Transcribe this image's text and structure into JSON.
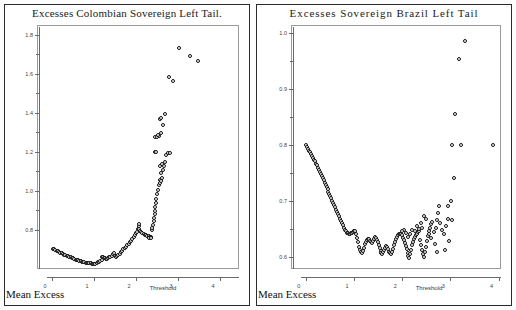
{
  "figure": {
    "axis_corner_label": "Mean Excess",
    "panels": [
      "left",
      "right"
    ]
  },
  "chart_data": [
    {
      "id": "colombia",
      "type": "scatter",
      "title": "Excesses Colombian Sovereign Left Tail.",
      "xlabel": "Threshold",
      "ylabel": "Mean Excess",
      "xlim": [
        -0.12,
        4.45
      ],
      "ylim": [
        0.6,
        1.84
      ],
      "xticks": [
        0,
        1,
        2,
        3,
        4
      ],
      "xticklabels": [
        "0",
        "1",
        "2",
        "3",
        "4"
      ],
      "yticks": [
        0.8,
        1.0,
        1.2,
        1.4,
        1.6,
        1.8
      ],
      "yticklabels": [
        "0.8",
        "1.0",
        "1.2",
        "1.4",
        "1.6",
        "1.8"
      ],
      "grid": false,
      "legend": null,
      "marker": "open-circle",
      "points": [
        [
          0.02,
          0.705
        ],
        [
          0.05,
          0.7
        ],
        [
          0.08,
          0.697
        ],
        [
          0.11,
          0.693
        ],
        [
          0.14,
          0.69
        ],
        [
          0.17,
          0.687
        ],
        [
          0.2,
          0.683
        ],
        [
          0.23,
          0.68
        ],
        [
          0.26,
          0.677
        ],
        [
          0.29,
          0.674
        ],
        [
          0.32,
          0.671
        ],
        [
          0.35,
          0.668
        ],
        [
          0.38,
          0.665
        ],
        [
          0.41,
          0.662
        ],
        [
          0.44,
          0.66
        ],
        [
          0.47,
          0.657
        ],
        [
          0.5,
          0.654
        ],
        [
          0.53,
          0.651
        ],
        [
          0.56,
          0.648
        ],
        [
          0.59,
          0.646
        ],
        [
          0.62,
          0.644
        ],
        [
          0.65,
          0.642
        ],
        [
          0.68,
          0.64
        ],
        [
          0.71,
          0.638
        ],
        [
          0.74,
          0.636
        ],
        [
          0.77,
          0.634
        ],
        [
          0.8,
          0.633
        ],
        [
          0.83,
          0.632
        ],
        [
          0.86,
          0.631
        ],
        [
          0.89,
          0.63
        ],
        [
          0.92,
          0.629
        ],
        [
          0.95,
          0.628
        ],
        [
          0.98,
          0.627
        ],
        [
          1.0,
          0.626
        ],
        [
          1.03,
          0.628
        ],
        [
          1.06,
          0.631
        ],
        [
          1.09,
          0.634
        ],
        [
          1.12,
          0.637
        ],
        [
          1.15,
          0.641
        ],
        [
          1.18,
          0.646
        ],
        [
          1.2,
          0.664
        ],
        [
          1.22,
          0.661
        ],
        [
          1.24,
          0.658
        ],
        [
          1.26,
          0.655
        ],
        [
          1.28,
          0.652
        ],
        [
          1.3,
          0.65
        ],
        [
          1.33,
          0.654
        ],
        [
          1.36,
          0.659
        ],
        [
          1.39,
          0.664
        ],
        [
          1.42,
          0.669
        ],
        [
          1.45,
          0.675
        ],
        [
          1.47,
          0.682
        ],
        [
          1.49,
          0.668
        ],
        [
          1.51,
          0.665
        ],
        [
          1.53,
          0.663
        ],
        [
          1.55,
          0.667
        ],
        [
          1.58,
          0.673
        ],
        [
          1.61,
          0.679
        ],
        [
          1.64,
          0.686
        ],
        [
          1.67,
          0.693
        ],
        [
          1.7,
          0.7
        ],
        [
          1.73,
          0.707
        ],
        [
          1.76,
          0.714
        ],
        [
          1.79,
          0.721
        ],
        [
          1.82,
          0.729
        ],
        [
          1.85,
          0.737
        ],
        [
          1.88,
          0.745
        ],
        [
          1.91,
          0.754
        ],
        [
          1.94,
          0.763
        ],
        [
          1.97,
          0.772
        ],
        [
          2.0,
          0.782
        ],
        [
          2.02,
          0.792
        ],
        [
          2.04,
          0.804
        ],
        [
          2.06,
          0.818
        ],
        [
          2.08,
          0.833
        ],
        [
          2.08,
          0.806
        ],
        [
          2.1,
          0.795
        ],
        [
          2.12,
          0.788
        ],
        [
          2.15,
          0.784
        ],
        [
          2.18,
          0.78
        ],
        [
          2.21,
          0.776
        ],
        [
          2.24,
          0.773
        ],
        [
          2.27,
          0.77
        ],
        [
          2.3,
          0.768
        ],
        [
          2.33,
          0.766
        ],
        [
          2.36,
          0.764
        ],
        [
          2.34,
          0.762
        ],
        [
          2.32,
          0.76
        ],
        [
          2.3,
          0.758
        ],
        [
          2.36,
          0.757
        ],
        [
          2.38,
          0.8
        ],
        [
          2.39,
          0.812
        ],
        [
          2.41,
          0.828
        ],
        [
          2.42,
          0.845
        ],
        [
          2.43,
          0.862
        ],
        [
          2.44,
          0.88
        ],
        [
          2.45,
          0.898
        ],
        [
          2.46,
          0.916
        ],
        [
          2.47,
          0.938
        ],
        [
          2.48,
          0.96
        ],
        [
          2.5,
          0.983
        ],
        [
          2.52,
          1.006
        ],
        [
          2.54,
          1.031
        ],
        [
          2.56,
          1.058
        ],
        [
          2.58,
          1.04
        ],
        [
          2.6,
          1.052
        ],
        [
          2.62,
          1.068
        ],
        [
          2.6,
          1.092
        ],
        [
          2.64,
          1.105
        ],
        [
          2.66,
          1.126
        ],
        [
          2.7,
          1.148
        ],
        [
          2.72,
          1.185
        ],
        [
          2.76,
          1.192
        ],
        [
          2.8,
          1.196
        ],
        [
          2.58,
          1.13
        ],
        [
          2.62,
          1.137
        ],
        [
          2.46,
          1.275
        ],
        [
          2.5,
          1.278
        ],
        [
          2.55,
          1.282
        ],
        [
          2.6,
          1.296
        ],
        [
          2.57,
          1.368
        ],
        [
          2.6,
          1.372
        ],
        [
          2.7,
          1.392
        ],
        [
          2.63,
          1.338
        ],
        [
          2.78,
          1.582
        ],
        [
          2.88,
          1.565
        ],
        [
          3.02,
          1.73
        ],
        [
          3.28,
          1.69
        ],
        [
          3.47,
          1.665
        ],
        [
          2.52,
          1.288
        ],
        [
          2.44,
          1.202
        ],
        [
          2.48,
          1.198
        ]
      ]
    },
    {
      "id": "brazil",
      "type": "scatter",
      "title": "Excesses Sovereign Brazil Left Tail",
      "xlabel": "Threshold",
      "ylabel": "Mean Excess",
      "xlim": [
        -0.1,
        4.05
      ],
      "ylim": [
        0.578,
        1.01
      ],
      "xticks": [
        0,
        1,
        2,
        3,
        4
      ],
      "xticklabels": [
        "0",
        "1",
        "2",
        "3",
        "4"
      ],
      "yticks": [
        0.6,
        0.7,
        0.8,
        0.9,
        1.0
      ],
      "yticklabels": [
        "0.6",
        "0.7",
        "0.8",
        "0.9",
        "1.0"
      ],
      "grid": false,
      "legend": null,
      "marker": "open-circle",
      "points": [
        [
          0.01,
          0.8
        ],
        [
          0.03,
          0.796
        ],
        [
          0.05,
          0.792
        ],
        [
          0.07,
          0.789
        ],
        [
          0.09,
          0.786
        ],
        [
          0.11,
          0.783
        ],
        [
          0.13,
          0.78
        ],
        [
          0.15,
          0.776
        ],
        [
          0.17,
          0.773
        ],
        [
          0.19,
          0.77
        ],
        [
          0.21,
          0.766
        ],
        [
          0.23,
          0.763
        ],
        [
          0.25,
          0.759
        ],
        [
          0.27,
          0.755
        ],
        [
          0.29,
          0.752
        ],
        [
          0.31,
          0.748
        ],
        [
          0.33,
          0.744
        ],
        [
          0.35,
          0.74
        ],
        [
          0.37,
          0.736
        ],
        [
          0.39,
          0.732
        ],
        [
          0.41,
          0.728
        ],
        [
          0.43,
          0.724
        ],
        [
          0.45,
          0.72
        ],
        [
          0.47,
          0.716
        ],
        [
          0.49,
          0.712
        ],
        [
          0.51,
          0.708
        ],
        [
          0.53,
          0.704
        ],
        [
          0.55,
          0.7
        ],
        [
          0.57,
          0.696
        ],
        [
          0.59,
          0.692
        ],
        [
          0.61,
          0.688
        ],
        [
          0.63,
          0.684
        ],
        [
          0.65,
          0.68
        ],
        [
          0.67,
          0.676
        ],
        [
          0.69,
          0.672
        ],
        [
          0.71,
          0.668
        ],
        [
          0.73,
          0.664
        ],
        [
          0.75,
          0.66
        ],
        [
          0.77,
          0.656
        ],
        [
          0.79,
          0.652
        ],
        [
          0.81,
          0.648
        ],
        [
          0.83,
          0.645
        ],
        [
          0.85,
          0.643
        ],
        [
          0.87,
          0.642
        ],
        [
          0.89,
          0.641
        ],
        [
          0.91,
          0.641
        ],
        [
          0.93,
          0.642
        ],
        [
          0.95,
          0.643
        ],
        [
          0.97,
          0.644
        ],
        [
          0.99,
          0.645
        ],
        [
          1.01,
          0.646
        ],
        [
          1.03,
          0.645
        ],
        [
          1.05,
          0.641
        ],
        [
          1.07,
          0.634
        ],
        [
          1.09,
          0.626
        ],
        [
          1.11,
          0.618
        ],
        [
          1.13,
          0.612
        ],
        [
          1.15,
          0.608
        ],
        [
          1.17,
          0.606
        ],
        [
          1.19,
          0.61
        ],
        [
          1.21,
          0.616
        ],
        [
          1.23,
          0.622
        ],
        [
          1.25,
          0.627
        ],
        [
          1.27,
          0.63
        ],
        [
          1.29,
          0.632
        ],
        [
          1.31,
          0.631
        ],
        [
          1.33,
          0.628
        ],
        [
          1.35,
          0.626
        ],
        [
          1.37,
          0.624
        ],
        [
          1.39,
          0.628
        ],
        [
          1.41,
          0.632
        ],
        [
          1.43,
          0.635
        ],
        [
          1.45,
          0.634
        ],
        [
          1.47,
          0.63
        ],
        [
          1.49,
          0.626
        ],
        [
          1.51,
          0.621
        ],
        [
          1.53,
          0.615
        ],
        [
          1.55,
          0.61
        ],
        [
          1.57,
          0.606
        ],
        [
          1.59,
          0.604
        ],
        [
          1.61,
          0.608
        ],
        [
          1.63,
          0.612
        ],
        [
          1.65,
          0.616
        ],
        [
          1.67,
          0.619
        ],
        [
          1.69,
          0.617
        ],
        [
          1.71,
          0.613
        ],
        [
          1.73,
          0.609
        ],
        [
          1.75,
          0.606
        ],
        [
          1.77,
          0.604
        ],
        [
          1.79,
          0.608
        ],
        [
          1.81,
          0.614
        ],
        [
          1.83,
          0.62
        ],
        [
          1.85,
          0.626
        ],
        [
          1.87,
          0.631
        ],
        [
          1.89,
          0.635
        ],
        [
          1.91,
          0.638
        ],
        [
          1.93,
          0.64
        ],
        [
          1.95,
          0.641
        ],
        [
          1.97,
          0.64
        ],
        [
          1.99,
          0.638
        ],
        [
          2.01,
          0.634
        ],
        [
          2.03,
          0.629
        ],
        [
          2.05,
          0.624
        ],
        [
          2.07,
          0.619
        ],
        [
          2.09,
          0.613
        ],
        [
          2.11,
          0.607
        ],
        [
          2.13,
          0.601
        ],
        [
          2.15,
          0.598
        ],
        [
          2.17,
          0.604
        ],
        [
          2.19,
          0.612
        ],
        [
          2.21,
          0.62
        ],
        [
          2.23,
          0.627
        ],
        [
          2.25,
          0.632
        ],
        [
          2.27,
          0.636
        ],
        [
          2.29,
          0.639
        ],
        [
          2.31,
          0.641
        ],
        [
          2.33,
          0.644
        ],
        [
          2.35,
          0.646
        ],
        [
          2.37,
          0.63
        ],
        [
          2.39,
          0.62
        ],
        [
          2.41,
          0.612
        ],
        [
          2.43,
          0.604
        ],
        [
          2.45,
          0.599
        ],
        [
          2.47,
          0.608
        ],
        [
          2.49,
          0.618
        ],
        [
          2.51,
          0.628
        ],
        [
          2.53,
          0.637
        ],
        [
          2.55,
          0.645
        ],
        [
          2.57,
          0.652
        ],
        [
          2.59,
          0.658
        ],
        [
          2.61,
          0.662
        ],
        [
          2.45,
          0.672
        ],
        [
          2.5,
          0.668
        ],
        [
          2.38,
          0.66
        ],
        [
          2.42,
          0.652
        ],
        [
          2.55,
          0.64
        ],
        [
          2.6,
          0.634
        ],
        [
          2.65,
          0.644
        ],
        [
          2.7,
          0.652
        ],
        [
          2.72,
          0.665
        ],
        [
          2.74,
          0.678
        ],
        [
          2.76,
          0.69
        ],
        [
          2.68,
          0.622
        ],
        [
          2.72,
          0.608
        ],
        [
          2.78,
          0.66
        ],
        [
          2.82,
          0.648
        ],
        [
          2.86,
          0.64
        ],
        [
          2.9,
          0.655
        ],
        [
          2.94,
          0.668
        ],
        [
          2.96,
          0.69
        ],
        [
          3.02,
          0.7
        ],
        [
          3.04,
          0.665
        ],
        [
          2.98,
          0.628
        ],
        [
          2.88,
          0.612
        ],
        [
          3.08,
          0.74
        ],
        [
          3.04,
          0.8
        ],
        [
          3.22,
          0.8
        ],
        [
          3.1,
          0.855
        ],
        [
          3.18,
          0.952
        ],
        [
          3.3,
          0.985
        ],
        [
          3.88,
          0.8
        ],
        [
          2.3,
          0.655
        ],
        [
          2.34,
          0.65
        ],
        [
          2.26,
          0.645
        ],
        [
          2.2,
          0.648
        ],
        [
          2.16,
          0.64
        ],
        [
          2.12,
          0.636
        ],
        [
          2.08,
          0.643
        ],
        [
          2.04,
          0.648
        ],
        [
          2.0,
          0.645
        ]
      ]
    }
  ]
}
